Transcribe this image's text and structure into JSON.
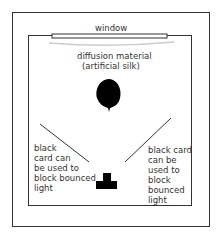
{
  "diagram": {
    "window_label": "window",
    "diffusion_label_line1": "diffusion material",
    "diffusion_label_line2": "(artificial silk)",
    "left_card_text": [
      "black",
      "card can",
      "be used to",
      "block bounced",
      "light"
    ],
    "right_card_text": [
      "black card",
      "can be",
      "used to",
      "block",
      "bounced",
      "light"
    ],
    "colors": {
      "stroke": "#333333",
      "subject": "#000000",
      "diffusion": "#cccccc"
    }
  }
}
